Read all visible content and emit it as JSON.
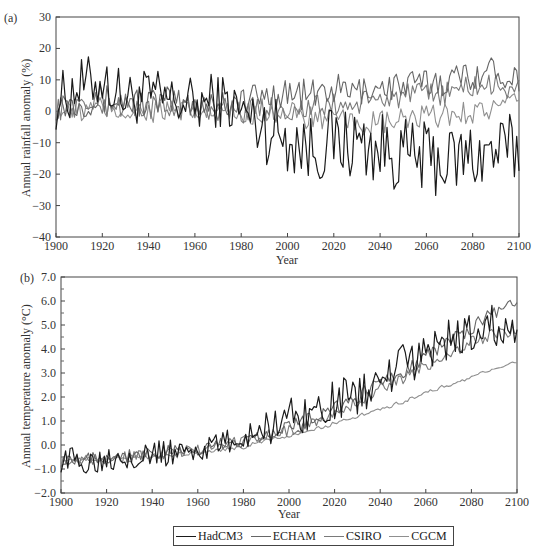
{
  "figure": {
    "panel_a_label": "(a)",
    "panel_b_label": "(b)",
    "legend": [
      {
        "name": "HadCM3",
        "color": "#1a1a1a"
      },
      {
        "name": "ECHAM",
        "color": "#666666"
      },
      {
        "name": "CSIRO",
        "color": "#7a7a7a"
      },
      {
        "name": "CGCM",
        "color": "#8f8f8f"
      }
    ]
  },
  "chart_data": [
    {
      "type": "line",
      "panel": "(a)",
      "title": "",
      "xlabel": "Year",
      "ylabel": "Annual rainfall anomaly (%)",
      "xlim": [
        1900,
        2100
      ],
      "ylim": [
        -40,
        30
      ],
      "xticks": [
        1900,
        1920,
        1940,
        1960,
        1980,
        2000,
        2020,
        2040,
        2060,
        2080,
        2100
      ],
      "yticks": [
        -40,
        -30,
        -20,
        -10,
        0,
        10,
        20,
        30
      ],
      "ytick_labels": [
        "-40",
        "-30",
        "-20",
        "-10",
        "0",
        "10",
        "20",
        "30"
      ],
      "grid": false,
      "x": [
        1900,
        1910,
        1920,
        1930,
        1940,
        1950,
        1960,
        1970,
        1980,
        1990,
        2000,
        2010,
        2020,
        2030,
        2040,
        2050,
        2060,
        2070,
        2080,
        2090,
        2100
      ],
      "series": [
        {
          "name": "HadCM3",
          "values": [
            3,
            8,
            10,
            4,
            5,
            3,
            2,
            4,
            0,
            -5,
            -8,
            -12,
            -10,
            -10,
            -12,
            -14,
            -15,
            -16,
            -14,
            -13,
            -12
          ]
        },
        {
          "name": "ECHAM",
          "values": [
            2,
            3,
            4,
            3,
            3,
            3,
            2,
            3,
            3,
            5,
            6,
            5,
            7,
            6,
            8,
            8,
            9,
            10,
            12,
            13,
            11
          ]
        },
        {
          "name": "CSIRO",
          "values": [
            1,
            2,
            2,
            2,
            1,
            1,
            1,
            1,
            0,
            1,
            0,
            1,
            2,
            2,
            4,
            5,
            5,
            6,
            8,
            8,
            7
          ]
        },
        {
          "name": "CGCM",
          "values": [
            0,
            0,
            1,
            0,
            0,
            0,
            -1,
            0,
            -1,
            0,
            -1,
            -2,
            -3,
            -4,
            -4,
            -3,
            -2,
            -1,
            0,
            1,
            2
          ]
        }
      ],
      "annotations": [
        "HadCM3 peaks ~25% near 1957 and ~25% near 2089; lows ~-33% near 2073"
      ]
    },
    {
      "type": "line",
      "panel": "(b)",
      "title": "",
      "xlabel": "Year",
      "ylabel": "Annual temperature anomaly (°C)",
      "xlim": [
        1900,
        2100
      ],
      "ylim": [
        -2.0,
        7.0
      ],
      "xticks": [
        1900,
        1920,
        1940,
        1960,
        1980,
        2000,
        2020,
        2040,
        2060,
        2080,
        2100
      ],
      "yticks": [
        -2.0,
        -1.0,
        0.0,
        1.0,
        2.0,
        3.0,
        4.0,
        5.0,
        6.0,
        7.0
      ],
      "ytick_labels": [
        "-2.0",
        "-1.0",
        "0.0",
        "1.0",
        "2.0",
        "3.0",
        "4.0",
        "5.0",
        "6.0",
        "7.0"
      ],
      "grid": false,
      "x": [
        1900,
        1910,
        1920,
        1930,
        1940,
        1950,
        1960,
        1970,
        1980,
        1990,
        2000,
        2010,
        2020,
        2030,
        2040,
        2050,
        2060,
        2070,
        2080,
        2090,
        2100
      ],
      "series": [
        {
          "name": "HadCM3",
          "values": [
            -0.6,
            -0.7,
            -0.5,
            -0.4,
            -0.4,
            -0.3,
            -0.2,
            0.0,
            0.3,
            0.8,
            1.2,
            1.4,
            1.8,
            2.1,
            2.6,
            3.3,
            3.8,
            4.4,
            4.6,
            5.0,
            4.7
          ]
        },
        {
          "name": "ECHAM",
          "values": [
            -0.6,
            -0.5,
            -0.5,
            -0.4,
            -0.3,
            -0.3,
            -0.2,
            0.0,
            0.2,
            0.5,
            0.8,
            1.1,
            1.5,
            2.0,
            2.6,
            3.1,
            3.7,
            4.3,
            4.9,
            5.5,
            6.0
          ]
        },
        {
          "name": "CSIRO",
          "values": [
            -0.7,
            -0.6,
            -0.5,
            -0.5,
            -0.4,
            -0.3,
            -0.2,
            0.0,
            0.2,
            0.4,
            0.6,
            0.9,
            1.3,
            1.8,
            2.3,
            2.8,
            3.3,
            3.8,
            4.3,
            4.6,
            4.8
          ]
        },
        {
          "name": "CGCM",
          "values": [
            -0.7,
            -0.6,
            -0.6,
            -0.5,
            -0.5,
            -0.4,
            -0.3,
            -0.2,
            -0.1,
            0.2,
            0.4,
            0.6,
            0.9,
            1.2,
            1.5,
            1.8,
            2.2,
            2.5,
            2.8,
            3.2,
            3.5
          ]
        }
      ]
    }
  ]
}
